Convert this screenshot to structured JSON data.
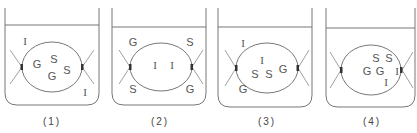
{
  "figure": {
    "legend_letters": [
      "G",
      "S",
      "I"
    ],
    "panels": [
      {
        "caption": "(1)",
        "outside": [
          {
            "t": "I",
            "x": 21,
            "y": 41
          },
          {
            "t": "I",
            "x": 81,
            "y": 92
          }
        ],
        "inside": [
          {
            "t": "G",
            "x": 33,
            "y": 64
          },
          {
            "t": "S",
            "x": 50,
            "y": 59
          },
          {
            "t": "G",
            "x": 48,
            "y": 76
          },
          {
            "t": "S",
            "x": 63,
            "y": 70
          }
        ]
      },
      {
        "caption": "(2)",
        "outside": [
          {
            "t": "G",
            "x": 22,
            "y": 42
          },
          {
            "t": "S",
            "x": 79,
            "y": 42
          },
          {
            "t": "S",
            "x": 22,
            "y": 89
          },
          {
            "t": "G",
            "x": 79,
            "y": 89
          }
        ],
        "inside": [
          {
            "t": "I",
            "x": 44,
            "y": 65
          },
          {
            "t": "I",
            "x": 61,
            "y": 65
          }
        ]
      },
      {
        "caption": "(3)",
        "outside": [
          {
            "t": "I",
            "x": 26,
            "y": 43
          },
          {
            "t": "G",
            "x": 26,
            "y": 89
          }
        ],
        "inside": [
          {
            "t": "I",
            "x": 45,
            "y": 60
          },
          {
            "t": "S",
            "x": 38,
            "y": 74
          },
          {
            "t": "S",
            "x": 52,
            "y": 74
          },
          {
            "t": "G",
            "x": 66,
            "y": 69
          }
        ]
      },
      {
        "caption": "(4)",
        "outside": [],
        "inside": [
          {
            "t": "S",
            "x": 51,
            "y": 58
          },
          {
            "t": "S",
            "x": 64,
            "y": 58
          },
          {
            "t": "G",
            "x": 42,
            "y": 71
          },
          {
            "t": "G",
            "x": 55,
            "y": 71
          },
          {
            "t": "I",
            "x": 72,
            "y": 71
          },
          {
            "t": "I",
            "x": 61,
            "y": 82
          }
        ]
      }
    ]
  }
}
